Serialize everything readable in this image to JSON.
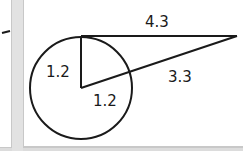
{
  "figure": {
    "type": "circle-tangent-secant",
    "labels": {
      "tangent_length": "4.3",
      "radius_vertical": "1.2",
      "radius_along_secant": "1.2",
      "external_secant_segment": "3.3"
    },
    "colors": {
      "stroke": "#1a1a1a",
      "panel_background": "#ffffff",
      "border": "#c8c8c8",
      "gutter": "#e2e2e2"
    }
  }
}
